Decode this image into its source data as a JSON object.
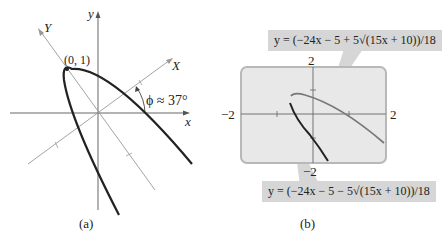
{
  "panel_a": {
    "caption": "(a)",
    "axis_x": "x",
    "axis_y": "y",
    "axis_X": "X",
    "axis_Y": "Y",
    "vertex_label": "(0, 1)",
    "angle_label": "ϕ ≈ 37°"
  },
  "panel_b": {
    "caption": "(b)",
    "eq_upper": "y = (−24x − 5 + 5√(15x + 10))/18",
    "eq_lower": "y = (−24x − 5 − 5√(15x + 10))/18",
    "tick_top": "2",
    "tick_bottom": "−2",
    "tick_left": "−2",
    "tick_right": "2",
    "screen_color": "#e6e6e6",
    "upper_curve_color": "#777777",
    "lower_curve_color": "#222222"
  }
}
